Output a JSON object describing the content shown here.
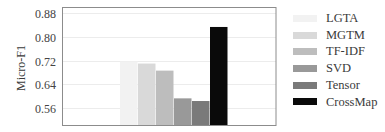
{
  "chart_data": {
    "type": "bar",
    "title": "",
    "xlabel": "",
    "ylabel": "Micro-F1",
    "ylim": [
      0.5,
      0.9
    ],
    "yticks": [
      0.56,
      0.64,
      0.72,
      0.8,
      0.88
    ],
    "ytick_labels": [
      "0.56",
      "0.64",
      "0.72",
      "0.80",
      "0.88"
    ],
    "grid": {
      "y": true,
      "x": false
    },
    "legend_position": "right",
    "categories": [
      "LGTA",
      "MGTM",
      "TF-IDF",
      "SVD",
      "Tensor",
      "CrossMap"
    ],
    "values": [
      0.717,
      0.71,
      0.686,
      0.592,
      0.583,
      0.834
    ],
    "series": [
      {
        "name": "LGTA",
        "value": 0.717,
        "color": "#f2f2f2"
      },
      {
        "name": "MGTM",
        "value": 0.71,
        "color": "#d9d9d9"
      },
      {
        "name": "TF-IDF",
        "value": 0.686,
        "color": "#bdbdbd"
      },
      {
        "name": "SVD",
        "value": 0.592,
        "color": "#999999"
      },
      {
        "name": "Tensor",
        "value": 0.583,
        "color": "#7a7a7a"
      },
      {
        "name": "CrossMap",
        "value": 0.834,
        "color": "#0a0a0a"
      }
    ]
  },
  "legend": {
    "items": [
      {
        "label": "LGTA",
        "color": "#f2f2f2"
      },
      {
        "label": "MGTM",
        "color": "#d9d9d9"
      },
      {
        "label": "TF-IDF",
        "color": "#bdbdbd"
      },
      {
        "label": "SVD",
        "color": "#999999"
      },
      {
        "label": "Tensor",
        "color": "#7a7a7a"
      },
      {
        "label": "CrossMap",
        "color": "#0a0a0a"
      }
    ]
  },
  "colors": {
    "frame": "#8c8c8c",
    "grid": "#ececec",
    "tick_text": "#444444"
  }
}
